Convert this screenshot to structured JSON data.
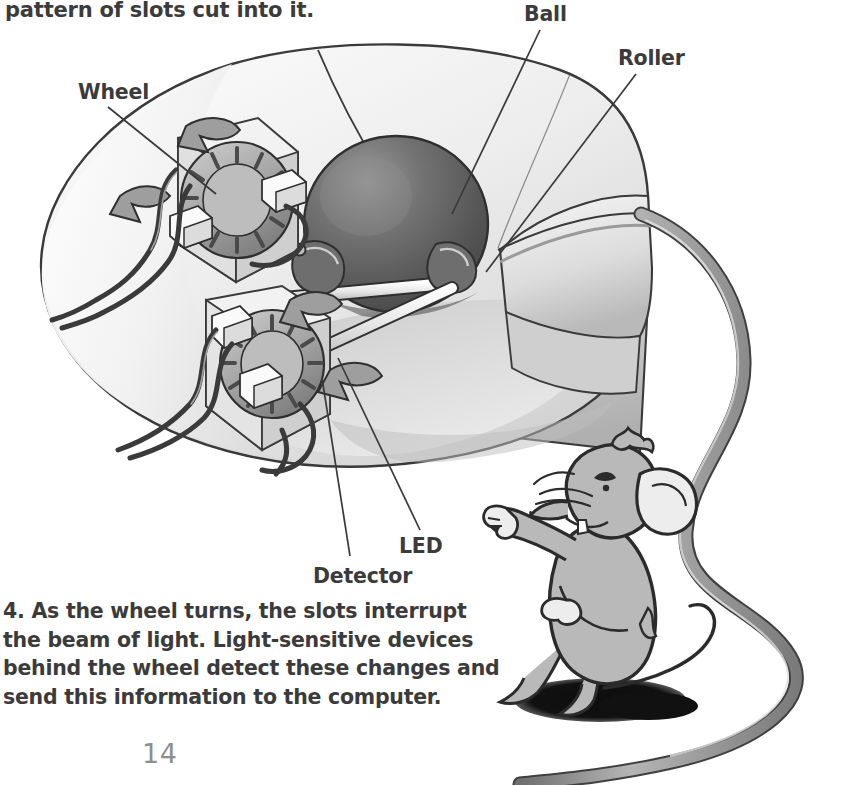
{
  "page": {
    "number": "14",
    "top_text": "pattern of slots cut into it.",
    "body_paragraph": "4. As the wheel turns, the slots interrupt the beam of light. Light-sensitive devices behind the wheel detect these changes and send this information to the computer."
  },
  "callouts": {
    "wheel": "Wheel",
    "ball": "Ball",
    "roller": "Roller",
    "led": "LED",
    "detector": "Detector"
  },
  "illustration": {
    "title": "cutaway-ball-mouse",
    "parts": [
      "mouse-body",
      "mouse-buttons",
      "mouse-cable",
      "trackball",
      "vertical-encoder-assembly",
      "horizontal-encoder-assembly",
      "roller-shafts",
      "led-blocks",
      "detector-blocks",
      "internal-wires"
    ],
    "mascot": "cartoon-mouse-waving"
  },
  "colors": {
    "text": "#3b3b3b",
    "page_number": "#8e8e8e",
    "paper": "#ffffff",
    "body_light": "#ededed",
    "body_mid": "#d4d4d4",
    "body_shadow": "#b4b4b4",
    "ball_dark": "#5c5c5c",
    "ball_light": "#8a8a8a",
    "cable": "#9a9a9a",
    "cable_outline": "#4a4a4a",
    "ink": "#2f2f2f",
    "mascot_fill": "#b9b9b9",
    "mascot_shadow": "#111111"
  }
}
